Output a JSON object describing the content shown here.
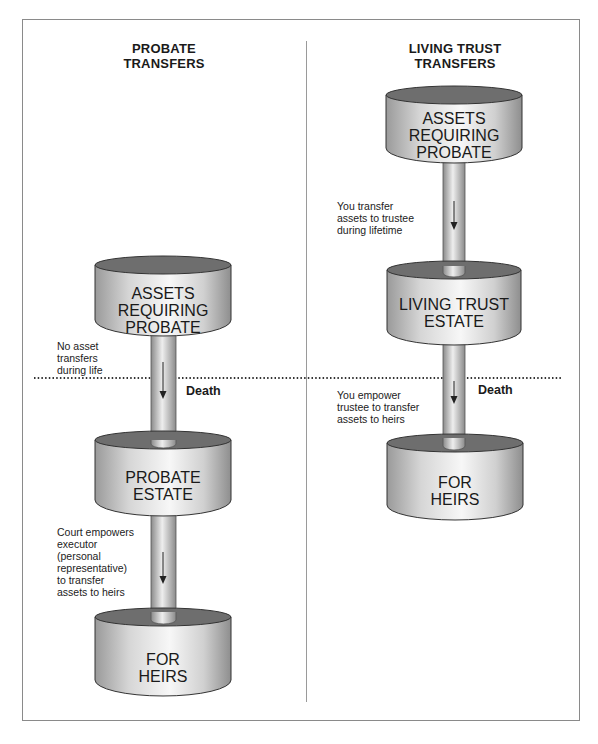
{
  "diagram": {
    "left_column": {
      "heading_line1": "PROBATE",
      "heading_line2": "TRANSFERS",
      "containers": [
        {
          "line1": "ASSETS",
          "line2": "REQUIRING",
          "line3": "PROBATE"
        },
        {
          "line1": "PROBATE",
          "line2": "ESTATE"
        },
        {
          "line1": "FOR",
          "line2": "HEIRS"
        }
      ],
      "notes": {
        "before_death": [
          "No asset",
          "transfers",
          "during life"
        ],
        "after_death": [
          "Court empowers",
          "executor",
          "(personal",
          "representative)",
          "to transfer",
          "assets to heirs"
        ]
      },
      "death_label": "Death"
    },
    "right_column": {
      "heading_line1": "LIVING TRUST",
      "heading_line2": "TRANSFERS",
      "containers": [
        {
          "line1": "ASSETS",
          "line2": "REQUIRING",
          "line3": "PROBATE"
        },
        {
          "line1": "LIVING TRUST",
          "line2": "ESTATE"
        },
        {
          "line1": "FOR",
          "line2": "HEIRS"
        }
      ],
      "notes": {
        "during_life": [
          "You transfer",
          "assets to trustee",
          "during lifetime"
        ],
        "after_death": [
          "You empower",
          "trustee to transfer",
          "assets to heirs"
        ]
      },
      "death_label": "Death"
    },
    "colors": {
      "cylinder_top": "#6e6e6e",
      "cylinder_side_light": "#f4f4f4",
      "cylinder_side_dark": "#9c9c9c",
      "frame": "#8a8a8a",
      "dotted_line": "#333333"
    }
  }
}
